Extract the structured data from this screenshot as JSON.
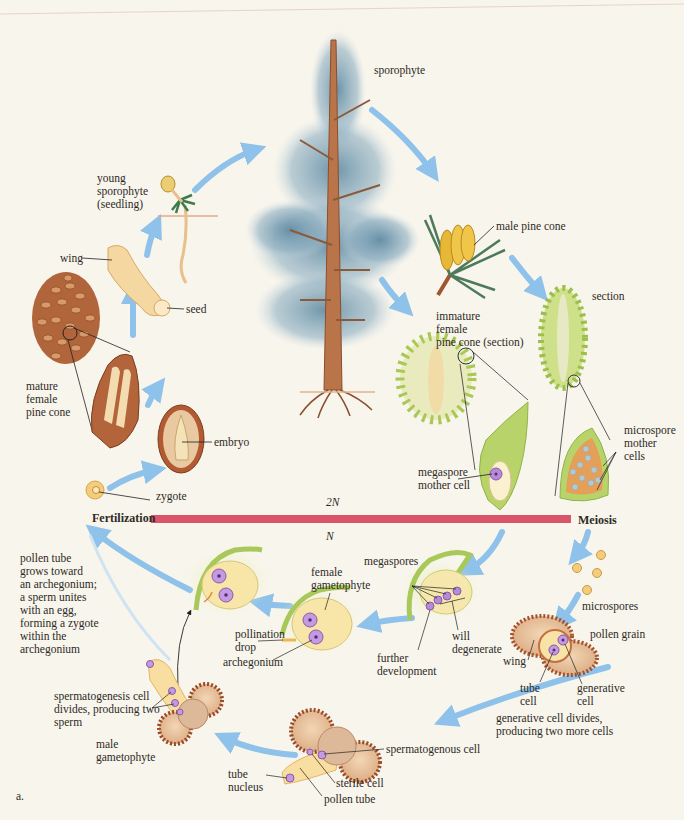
{
  "diagram": {
    "figure_label": "a.",
    "divider": {
      "left_label": "Fertilization",
      "right_label": "Meiosis",
      "above_label": "2N",
      "below_label": "N",
      "color": "#d9566a"
    },
    "colors": {
      "background": "#f8f5ec",
      "arrow": "#8ec2ea",
      "tree_foliage": "#7fa3b8",
      "trunk": "#b9744a",
      "cone_green": "#b9d36a",
      "pollen_brown": "#a5512c",
      "nucleus_purple": "#b58ad6"
    },
    "labels": {
      "sporophyte": "sporophyte",
      "male_pine_cone": "male pine cone",
      "section": "section",
      "immature_female_cone": "immature\nfemale\npine cone (section)",
      "microspore_mother_cells": "microspore\nmother\ncells",
      "megaspore_mother_cell": "megaspore\nmother cell",
      "young_sporophyte": "young\nsporophyte\n(seedling)",
      "wing_seed": "wing",
      "seed": "seed",
      "mature_female_cone": "mature\nfemale\npine cone",
      "embryo": "embryo",
      "zygote": "zygote",
      "pollen_tube_text": "pollen tube\ngrows toward\nan archegonium;\na sperm unites\nwith an egg,\nforming a zygote\nwithin the\narchegonium",
      "female_gametophyte": "female\ngametophyte",
      "pollination_drop": "pollination\ndrop",
      "archegonium": "archegonium",
      "megaspores": "megaspores",
      "further_development": "further\ndevelopment",
      "will_degenerate": "will\ndegenerate",
      "microspores": "microspores",
      "pollen_grain": "pollen grain",
      "wing_pollen": "wing",
      "tube_cell": "tube\ncell",
      "generative_cell": "generative\ncell",
      "generative_divides": "generative cell divides,\nproducing two more cells",
      "spermatogenesis": "spermatogenesis cell\ndivides, producing two\nsperm",
      "male_gametophyte": "male\ngametophyte",
      "spermatogenous_cell": "spermatogenous cell",
      "tube_nucleus": "tube\nnucleus",
      "sterile_cell": "sterile cell",
      "pollen_tube": "pollen tube"
    }
  }
}
